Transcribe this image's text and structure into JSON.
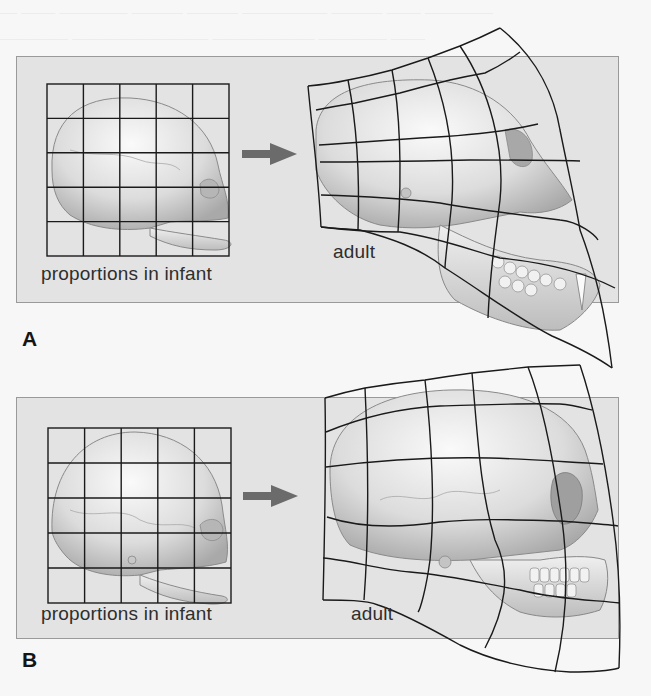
{
  "figure": {
    "panels": [
      {
        "id": "A",
        "letter": "A",
        "infant_label": "proportions in infant",
        "adult_label": "adult",
        "subject": "chimpanzee skull"
      },
      {
        "id": "B",
        "letter": "B",
        "infant_label": "proportions in infant",
        "adult_label": "adult",
        "subject": "human skull"
      }
    ],
    "grid": {
      "rows": 5,
      "cols": 5
    },
    "colors": {
      "panel_bg": "#e3e3e3",
      "page_bg": "#f7f7f7",
      "grid_line": "#1a1a1a",
      "arrow": "#6b6b6b",
      "skull_fill": "#d9d9d9"
    }
  }
}
